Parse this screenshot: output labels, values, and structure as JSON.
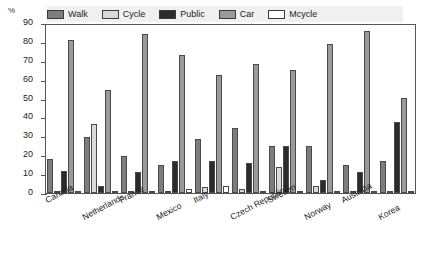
{
  "chart_data": {
    "type": "bar",
    "title": "",
    "xlabel": "",
    "ylabel": "%",
    "ylim": [
      0,
      90
    ],
    "yticks": [
      0,
      10,
      20,
      30,
      40,
      50,
      60,
      70,
      80,
      90
    ],
    "grid": false,
    "legend_position": "top",
    "categories": [
      "Canada",
      "Netherlands",
      "France",
      "Mexico",
      "Italy",
      "Czech Republic",
      "Sweden",
      "Norway",
      "Australia",
      "Korea"
    ],
    "series": [
      {
        "name": "Walk",
        "color": "#7d7d7d",
        "values": [
          18,
          30,
          20,
          15,
          29,
          35,
          25,
          25,
          15,
          17
        ]
      },
      {
        "name": "Cycle",
        "color": "#d9d9d9",
        "values": [
          1,
          37,
          1,
          1,
          3,
          2,
          14,
          4,
          1,
          1
        ]
      },
      {
        "name": "Public",
        "color": "#2b2b2b",
        "values": [
          12,
          4,
          11,
          17,
          17,
          16,
          25,
          7,
          11,
          38
        ]
      },
      {
        "name": "Car",
        "color": "#9a9a9a",
        "values": [
          82,
          55,
          85,
          74,
          63,
          69,
          66,
          80,
          87,
          51
        ]
      },
      {
        "name": "Mcycle",
        "color": "#ffffff",
        "values": [
          1,
          1,
          1,
          2,
          4,
          1,
          1,
          1,
          1,
          1
        ]
      }
    ]
  },
  "legend": {
    "items": [
      {
        "label": "Walk",
        "swatch": "walk"
      },
      {
        "label": "Cycle",
        "swatch": "cycle"
      },
      {
        "label": "Public",
        "swatch": "public"
      },
      {
        "label": "Car",
        "swatch": "car"
      },
      {
        "label": "Mcycle",
        "swatch": "mcycle"
      }
    ]
  },
  "axis": {
    "percent_symbol": "%"
  }
}
